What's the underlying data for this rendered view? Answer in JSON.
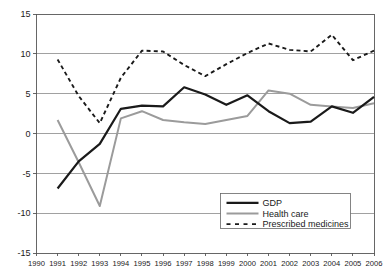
{
  "chart_data": {
    "type": "line",
    "title": "",
    "subtitle": "",
    "xlabel": "",
    "ylabel": "",
    "xlim": [
      1990,
      2006
    ],
    "ylim": [
      -15,
      15
    ],
    "grid": true,
    "legend_position": "bottom-right",
    "x": [
      1990,
      1991,
      1992,
      1993,
      1994,
      1995,
      1996,
      1997,
      1998,
      1999,
      2000,
      2001,
      2002,
      2003,
      2004,
      2005,
      2006
    ],
    "xticklabels": [
      "1990",
      "1991",
      "1992",
      "1993",
      "1994",
      "1995",
      "1996",
      "1997",
      "1998",
      "1999",
      "2000",
      "2001",
      "2002",
      "2003",
      "2004",
      "2005",
      "2006"
    ],
    "yticks": [
      15,
      10,
      5,
      0,
      -5,
      -10,
      -15
    ],
    "yticklabels": [
      "15",
      "10",
      "5",
      "0",
      "-5",
      "-10",
      "-15"
    ],
    "series": [
      {
        "name": "GDP",
        "style": "solid",
        "color": "#1a1a1a",
        "width": 2.2,
        "x": [
          1991,
          1992,
          1993,
          1994,
          1995,
          1996,
          1997,
          1998,
          1999,
          2000,
          2001,
          2002,
          2003,
          2004,
          2005,
          2006
        ],
        "values": [
          -6.9,
          -3.5,
          -1.3,
          3.1,
          3.5,
          3.4,
          5.8,
          4.9,
          3.6,
          4.8,
          2.8,
          1.3,
          1.5,
          3.4,
          2.6,
          4.6
        ]
      },
      {
        "name": "Health care",
        "style": "solid",
        "color": "#9b9b9b",
        "width": 2.0,
        "x": [
          1991,
          1992,
          1993,
          1994,
          1995,
          1996,
          1997,
          1998,
          1999,
          2000,
          2001,
          2002,
          2003,
          2004,
          2005,
          2006
        ],
        "values": [
          1.7,
          -3.6,
          -9.1,
          1.9,
          2.8,
          1.7,
          1.4,
          1.2,
          1.7,
          2.2,
          5.4,
          5.0,
          3.6,
          3.4,
          3.2,
          3.8
        ]
      },
      {
        "name": "Prescribed medicines",
        "style": "dashed",
        "color": "#1a1a1a",
        "width": 1.9,
        "x": [
          1991,
          1992,
          1993,
          1994,
          1995,
          1996,
          1997,
          1998,
          1999,
          2000,
          2001,
          2002,
          2003,
          2004,
          2005,
          2006
        ],
        "values": [
          9.3,
          4.7,
          1.3,
          7.0,
          10.4,
          10.3,
          8.6,
          7.2,
          8.7,
          10.1,
          11.3,
          10.5,
          10.3,
          12.4,
          9.2,
          10.4
        ]
      }
    ]
  },
  "legend": {
    "items": [
      {
        "label": "GDP"
      },
      {
        "label": "Health care"
      },
      {
        "label": "Prescribed medicines"
      }
    ]
  }
}
